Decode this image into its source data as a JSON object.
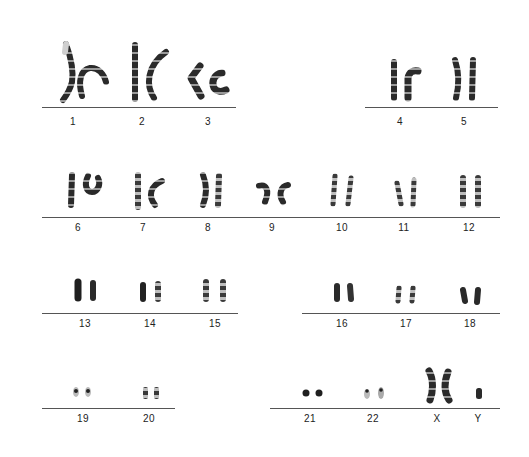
{
  "figure": {
    "type": "karyotype",
    "rows": [
      {
        "groups": [
          {
            "line": {
              "x1": 42,
              "x2": 236,
              "y": 107
            },
            "chromosomes": [
              {
                "label": "1",
                "x": 73
              },
              {
                "label": "2",
                "x": 142
              },
              {
                "label": "3",
                "x": 208
              }
            ]
          },
          {
            "line": {
              "x1": 365,
              "x2": 498,
              "y": 107
            },
            "chromosomes": [
              {
                "label": "4",
                "x": 400
              },
              {
                "label": "5",
                "x": 464
              }
            ]
          }
        ],
        "label_y": 116
      },
      {
        "groups": [
          {
            "line": {
              "x1": 42,
              "x2": 500,
              "y": 217
            },
            "chromosomes": [
              {
                "label": "6",
                "x": 78
              },
              {
                "label": "7",
                "x": 143
              },
              {
                "label": "8",
                "x": 208
              },
              {
                "label": "9",
                "x": 272
              },
              {
                "label": "10",
                "x": 342
              },
              {
                "label": "11",
                "x": 404
              },
              {
                "label": "12",
                "x": 469
              }
            ]
          }
        ],
        "label_y": 222
      },
      {
        "groups": [
          {
            "line": {
              "x1": 42,
              "x2": 238,
              "y": 313
            },
            "chromosomes": [
              {
                "label": "13",
                "x": 85
              },
              {
                "label": "14",
                "x": 150
              },
              {
                "label": "15",
                "x": 215
              }
            ]
          },
          {
            "line": {
              "x1": 302,
              "x2": 500,
              "y": 313
            },
            "chromosomes": [
              {
                "label": "16",
                "x": 342
              },
              {
                "label": "17",
                "x": 406
              },
              {
                "label": "18",
                "x": 470
              }
            ]
          }
        ],
        "label_y": 318
      },
      {
        "groups": [
          {
            "line": {
              "x1": 42,
              "x2": 175,
              "y": 408
            },
            "chromosomes": [
              {
                "label": "19",
                "x": 83
              },
              {
                "label": "20",
                "x": 149
              }
            ]
          },
          {
            "line": {
              "x1": 270,
              "x2": 500,
              "y": 408
            },
            "chromosomes": [
              {
                "label": "21",
                "x": 310
              },
              {
                "label": "22",
                "x": 373
              },
              {
                "label": "X",
                "x": 437
              },
              {
                "label": "Y",
                "x": 478
              }
            ]
          }
        ],
        "label_y": 413
      }
    ]
  }
}
